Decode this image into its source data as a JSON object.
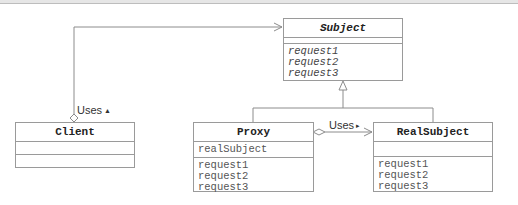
{
  "diagram": {
    "type": "UML class diagram (Proxy pattern)",
    "classes": {
      "subject": {
        "name": "Subject",
        "abstract": true,
        "attributes": [],
        "operations": [
          "request1",
          "request2",
          "request3"
        ]
      },
      "client": {
        "name": "Client",
        "attributes": [],
        "operations": []
      },
      "proxy": {
        "name": "Proxy",
        "attributes": [
          "realSubject"
        ],
        "operations": [
          "request1",
          "request2",
          "request3"
        ]
      },
      "realsubject": {
        "name": "RealSubject",
        "attributes": [],
        "operations": [
          "request1",
          "request2",
          "request3"
        ]
      }
    },
    "relations": {
      "client_subject": {
        "kind": "aggregation",
        "label": "Uses",
        "direction_glyph": "▲"
      },
      "proxy_realsubject": {
        "kind": "aggregation",
        "label": "Uses",
        "direction_glyph": "▸"
      },
      "generalization": {
        "kind": "generalization",
        "parent": "Subject",
        "children": [
          "Proxy",
          "RealSubject"
        ]
      }
    },
    "colors": {
      "line": "#8c8c8c",
      "box_border": "#9a9a9a",
      "text": "#222222",
      "member_text": "#555555"
    }
  }
}
